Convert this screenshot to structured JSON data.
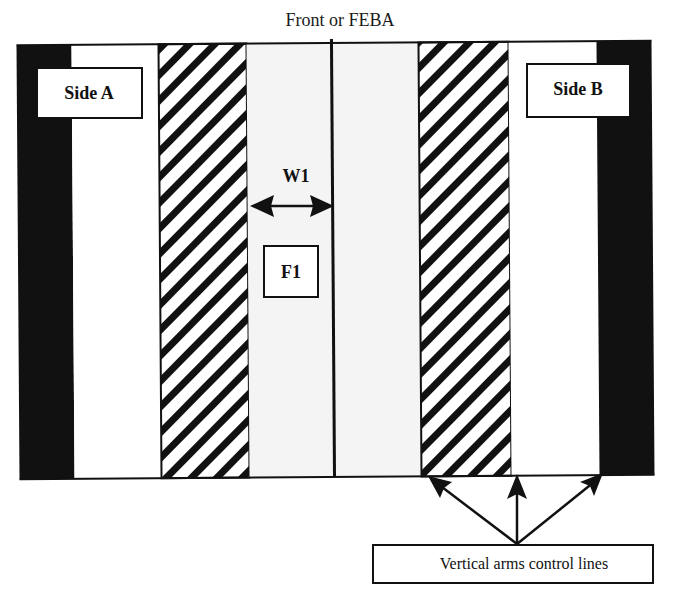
{
  "diagram": {
    "title": "Front or FEBA",
    "side_a_label": "Side A",
    "side_b_label": "Side B",
    "width_label": "W1",
    "force_label": "F1",
    "callout_label": "Vertical arms control lines",
    "colors": {
      "background": "#ffffff",
      "black_band": "#111111",
      "light_zone": "#f4f4f4",
      "stroke": "#111111",
      "hatch": "#111111"
    },
    "bands": [
      {
        "name": "side-a-black-band",
        "fill": "black"
      },
      {
        "name": "side-a-white-zone",
        "fill": "white"
      },
      {
        "name": "side-a-hatched-band",
        "fill": "hatch"
      },
      {
        "name": "side-a-light-zone",
        "fill": "light"
      },
      {
        "name": "center-front-line",
        "fill": "line"
      },
      {
        "name": "side-b-light-zone",
        "fill": "light"
      },
      {
        "name": "side-b-hatched-band",
        "fill": "hatch"
      },
      {
        "name": "side-b-white-zone",
        "fill": "white"
      },
      {
        "name": "side-b-black-band",
        "fill": "black"
      }
    ],
    "arrows": {
      "width_arrow": "double-headed",
      "callout_arrow_count": 3
    }
  }
}
